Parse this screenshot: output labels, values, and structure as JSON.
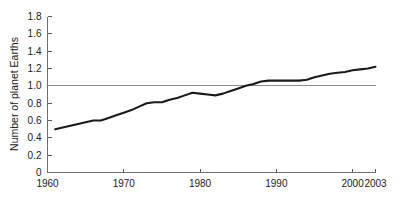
{
  "chart_data": {
    "type": "line",
    "title": "",
    "xlabel": "",
    "ylabel": "Number of planet Earths",
    "xlim": [
      1960,
      2003
    ],
    "ylim": [
      0,
      1.8
    ],
    "grid": false,
    "legend": "none",
    "x_ticks": [
      "1960",
      "1970",
      "1980",
      "1990",
      "2000",
      "2003"
    ],
    "x_tick_values": [
      1960,
      1970,
      1980,
      1990,
      2000,
      2003
    ],
    "y_ticks": [
      "0",
      "0.2",
      "0.4",
      "0.6",
      "0.8",
      "1.0",
      "1.2",
      "1.4",
      "1.6",
      "1.8"
    ],
    "y_tick_values": [
      0,
      0.2,
      0.4,
      0.6,
      0.8,
      1.0,
      1.2,
      1.4,
      1.6,
      1.8
    ],
    "annotations": [
      {
        "name": "one-earth-reference-line",
        "type": "hline",
        "y": 1.0,
        "label": ""
      }
    ],
    "series": [
      {
        "name": "Ecological footprint",
        "color": "#1a1a1a",
        "x": [
          1961,
          1962,
          1963,
          1964,
          1965,
          1966,
          1967,
          1968,
          1969,
          1970,
          1971,
          1972,
          1973,
          1974,
          1975,
          1976,
          1977,
          1978,
          1979,
          1980,
          1981,
          1982,
          1983,
          1984,
          1985,
          1986,
          1987,
          1988,
          1989,
          1990,
          1991,
          1992,
          1993,
          1994,
          1995,
          1996,
          1997,
          1998,
          1999,
          2000,
          2001,
          2002,
          2003
        ],
        "values": [
          0.5,
          0.52,
          0.54,
          0.56,
          0.58,
          0.6,
          0.6,
          0.63,
          0.66,
          0.69,
          0.72,
          0.76,
          0.8,
          0.81,
          0.81,
          0.84,
          0.86,
          0.89,
          0.92,
          0.91,
          0.9,
          0.89,
          0.91,
          0.94,
          0.97,
          1.0,
          1.02,
          1.05,
          1.06,
          1.06,
          1.06,
          1.06,
          1.06,
          1.07,
          1.1,
          1.12,
          1.14,
          1.15,
          1.16,
          1.18,
          1.19,
          1.2,
          1.22
        ]
      }
    ]
  }
}
